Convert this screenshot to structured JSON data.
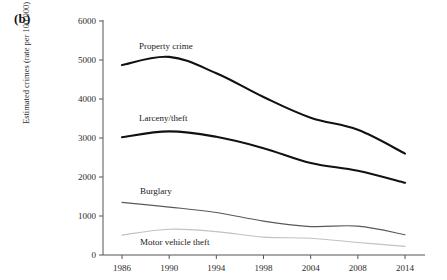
{
  "figure": {
    "panel_label": "(b)",
    "ylabel": "Estimated crimes (rate per 100,000)"
  },
  "chart_data": {
    "type": "line",
    "title": "",
    "xlabel": "",
    "ylabel": "Estimated crimes (rate per 100,000)",
    "categories": [
      "1986",
      "1990",
      "1994",
      "1998",
      "2004",
      "2008",
      "2014"
    ],
    "xtick_labels": [
      "1986",
      "1990",
      "1994",
      "1998",
      "2004",
      "2008",
      "2014"
    ],
    "ytick_labels": [
      "0",
      "1000",
      "2000",
      "3000",
      "4000",
      "5000",
      "6000"
    ],
    "ylim": [
      0,
      6000
    ],
    "ytick_step": 1000,
    "grid": false,
    "legend_position": "inline-labels",
    "series": [
      {
        "name": "Property crime",
        "label": "Property crime",
        "color": "#111111",
        "width": 2.1,
        "values": [
          4870,
          5080,
          4660,
          4050,
          3520,
          3210,
          2600
        ]
      },
      {
        "name": "Larceny/theft",
        "label": "Larceny/theft",
        "color": "#111111",
        "width": 2.1,
        "values": [
          3020,
          3170,
          3030,
          2740,
          2360,
          2160,
          1850
        ]
      },
      {
        "name": "Burglary",
        "label": "Burglary",
        "color": "#595959",
        "width": 1.2,
        "values": [
          1350,
          1230,
          1090,
          870,
          730,
          740,
          520
        ]
      },
      {
        "name": "Motor vehicle theft",
        "label": "Motor vehicle theft",
        "color": "#c2c2c2",
        "width": 1.2,
        "values": [
          510,
          660,
          600,
          460,
          430,
          320,
          220
        ]
      }
    ],
    "annotations": [
      {
        "text": "Property crime",
        "x_px": 139,
        "y_px": 49
      },
      {
        "text": "Larceny/theft",
        "x_px": 139,
        "y_px": 121
      },
      {
        "text": "Burglary",
        "x_px": 140,
        "y_px": 194
      },
      {
        "text": "Motor vehicle theft",
        "x_px": 140,
        "y_px": 245
      }
    ]
  }
}
